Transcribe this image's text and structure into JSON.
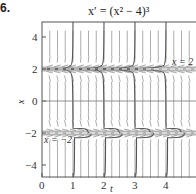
{
  "problem_number": "6.",
  "chart_data": {
    "type": "line",
    "title": "x′ = (x² − 4)³",
    "xlabel": "t",
    "ylabel": "x",
    "xlim": [
      0,
      5
    ],
    "ylim": [
      -5,
      5
    ],
    "x_ticks": [
      "0",
      "1",
      "2",
      "3",
      "4"
    ],
    "y_ticks": [
      "4",
      "2",
      "0",
      "−2",
      "−4"
    ],
    "grid": false,
    "direction_field": true,
    "equilibria": [
      {
        "name": "x = 2",
        "value": 2,
        "label": "x = 2",
        "style": "dashed",
        "stability": "unstable"
      },
      {
        "name": "x = −2",
        "value": -2,
        "label": "x = −2",
        "style": "dashed",
        "stability": "stable"
      }
    ],
    "series": [
      {
        "name": "solution leaving x=2 upward near t=1",
        "points": [
          [
            0,
            2.02
          ],
          [
            0.9,
            2.2
          ],
          [
            1.0,
            5
          ]
        ]
      },
      {
        "name": "solution leaving x=2 upward near t=2",
        "points": [
          [
            0,
            2.01
          ],
          [
            1.9,
            2.2
          ],
          [
            2.0,
            5
          ]
        ]
      },
      {
        "name": "solution leaving x=2 upward near t=3",
        "points": [
          [
            0,
            2.005
          ],
          [
            2.9,
            2.2
          ],
          [
            3.0,
            5
          ]
        ]
      },
      {
        "name": "solution leaving x=2 upward near t=4",
        "points": [
          [
            0,
            2.002
          ],
          [
            3.9,
            2.2
          ],
          [
            4.0,
            5
          ]
        ]
      },
      {
        "name": "solution falling from x=2 to x=-2 near t=1",
        "points": [
          [
            0,
            1.98
          ],
          [
            0.9,
            1.8
          ],
          [
            1.0,
            -1.7
          ],
          [
            1.5,
            -2
          ]
        ]
      },
      {
        "name": "solution falling from x=2 to x=-2 near t=2",
        "points": [
          [
            0,
            1.99
          ],
          [
            1.9,
            1.8
          ],
          [
            2.0,
            -1.7
          ],
          [
            2.5,
            -2
          ]
        ]
      },
      {
        "name": "solution falling from x=2 to x=-2 near t=3",
        "points": [
          [
            0,
            1.995
          ],
          [
            2.9,
            1.8
          ],
          [
            3.0,
            -1.7
          ],
          [
            3.5,
            -2
          ]
        ]
      },
      {
        "name": "solution falling from x=2 to x=-2 near t=4",
        "points": [
          [
            0,
            1.998
          ],
          [
            3.9,
            1.8
          ],
          [
            4.0,
            -1.7
          ],
          [
            4.5,
            -2
          ]
        ]
      },
      {
        "name": "solution rising from below to x=-2 near t=1",
        "points": [
          [
            1.0,
            -5
          ],
          [
            1.05,
            -2.3
          ],
          [
            1.6,
            -2
          ]
        ]
      },
      {
        "name": "solution rising from below to x=-2 near t=2",
        "points": [
          [
            2.0,
            -5
          ],
          [
            2.05,
            -2.3
          ],
          [
            2.6,
            -2
          ]
        ]
      },
      {
        "name": "solution rising from below to x=-2 near t=3",
        "points": [
          [
            3.0,
            -5
          ],
          [
            3.05,
            -2.3
          ],
          [
            3.6,
            -2
          ]
        ]
      },
      {
        "name": "solution rising from below to x=-2 near t=4",
        "points": [
          [
            4.0,
            -5
          ],
          [
            4.05,
            -2.3
          ],
          [
            4.6,
            -2
          ]
        ]
      }
    ]
  }
}
